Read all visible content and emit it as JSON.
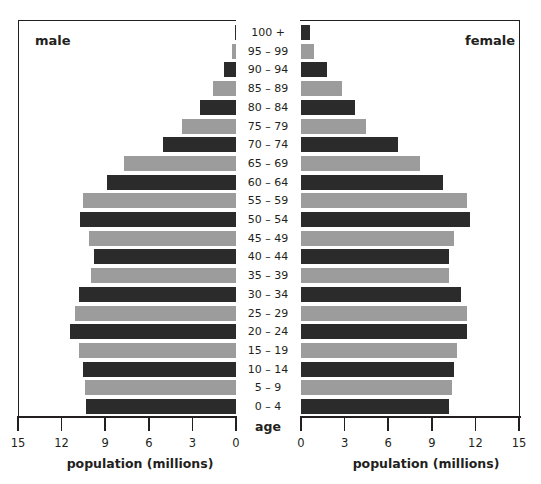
{
  "labels": {
    "male": "male",
    "female": "female",
    "age": "age",
    "x_axis_left": "population (millions)",
    "x_axis_right": "population (millions)"
  },
  "colors": {
    "dark": "#2b2b2b",
    "light": "#9c9c9c",
    "axis": "#231f20"
  },
  "chart_data": {
    "type": "bar",
    "subtype": "population-pyramid",
    "title": "",
    "xlabel": "population (millions)",
    "ylabel": "age",
    "xlim": [
      0,
      15
    ],
    "xticks": [
      0,
      3,
      6,
      9,
      12,
      15
    ],
    "categories": [
      "100 +",
      "95 – 99",
      "90 – 94",
      "85 – 89",
      "80 – 84",
      "75 – 79",
      "70 – 74",
      "65 – 69",
      "60 – 64",
      "55 – 59",
      "50 – 54",
      "45 – 49",
      "40 – 44",
      "35 – 39",
      "30 – 34",
      "25 – 29",
      "20 – 24",
      "15 – 19",
      "10 – 14",
      "5 – 9",
      "0 – 4"
    ],
    "series": [
      {
        "name": "male",
        "values": [
          0.1,
          0.3,
          0.8,
          1.6,
          2.5,
          3.7,
          5.0,
          7.7,
          8.9,
          10.5,
          10.7,
          10.1,
          9.8,
          10.0,
          10.8,
          11.1,
          11.4,
          10.8,
          10.5,
          10.4,
          10.3
        ]
      },
      {
        "name": "female",
        "values": [
          0.6,
          0.9,
          1.8,
          2.8,
          3.7,
          4.5,
          6.7,
          8.2,
          9.8,
          11.4,
          11.6,
          10.5,
          10.2,
          10.2,
          11.0,
          11.4,
          11.4,
          10.7,
          10.5,
          10.4,
          10.2
        ]
      }
    ],
    "bar_color_pattern": "alternating dark/light by row starting dark at 100+",
    "legend": "none (panel labels 'male' top-left, 'female' top-right)",
    "grid": false
  }
}
